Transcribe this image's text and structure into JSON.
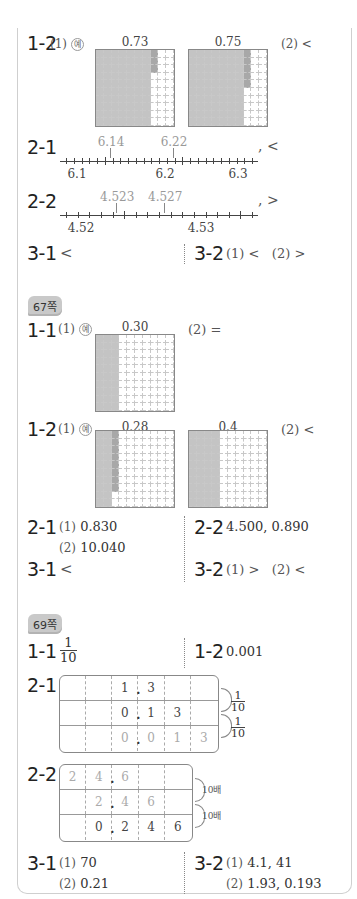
{
  "section_top": {
    "q1_2": {
      "label": "1-2",
      "part1": "(1)",
      "ex": "예",
      "grid_a_label": "0.73",
      "grid_b_label": "0.75",
      "part2": "(2) <"
    },
    "q2_1": {
      "label": "2-1",
      "marks": [
        "6.14",
        "6.22"
      ],
      "ticks": [
        "6.1",
        "6.2",
        "6.3"
      ],
      "answer": ", <"
    },
    "q2_2": {
      "label": "2-2",
      "marks": [
        "4.523",
        "4.527"
      ],
      "ticks": [
        "4.52",
        "4.53"
      ],
      "answer": ", >"
    },
    "q3_1": {
      "label": "3-1",
      "answer": "<"
    },
    "q3_2": {
      "label": "3-2",
      "p1": "(1) <",
      "p2": "(2) >"
    }
  },
  "page67": {
    "badge": "67쪽",
    "q1_1": {
      "label": "1-1",
      "part1": "(1)",
      "ex": "예",
      "grid_label": "0.30",
      "part2": "(2) ="
    },
    "q1_2": {
      "label": "1-2",
      "part1": "(1)",
      "ex": "예",
      "grid_a_label": "0.28",
      "grid_b_label": "0.4",
      "part2": "(2) <"
    },
    "q2_1": {
      "label": "2-1",
      "p1_num": "(1)",
      "p1": "0.830",
      "p2_num": "(2)",
      "p2": "10.040"
    },
    "q2_2": {
      "label": "2-2",
      "answer": "4.500, 0.890"
    },
    "q3_1": {
      "label": "3-1",
      "answer": "<"
    },
    "q3_2": {
      "label": "3-2",
      "p1": "(1) >",
      "p2": "(2) <"
    }
  },
  "page69": {
    "badge": "69쪽",
    "q1_1": {
      "label": "1-1",
      "num": "1",
      "den": "10"
    },
    "q1_2": {
      "label": "1-2",
      "answer": "0.001"
    },
    "q2_1": {
      "label": "2-1",
      "rows": [
        [
          "",
          "",
          "1",
          "3",
          "",
          ""
        ],
        [
          "",
          "",
          "0",
          "1",
          "3",
          ""
        ],
        [
          "",
          "",
          "0",
          "0",
          "1",
          "3"
        ]
      ],
      "arrow_num": "1",
      "arrow_den": "10"
    },
    "q2_2": {
      "label": "2-2",
      "rows": [
        [
          "2",
          "4",
          "6",
          "",
          ""
        ],
        [
          "",
          "2",
          "4",
          "6",
          ""
        ],
        [
          "",
          "0",
          "2",
          "4",
          "6"
        ]
      ],
      "arrow_label": "10배"
    },
    "q3_1": {
      "label": "3-1",
      "p1_num": "(1)",
      "p1": "70",
      "p2_num": "(2)",
      "p2": "0.21"
    },
    "q3_2": {
      "label": "3-2",
      "p1_num": "(1)",
      "p1": "4.1, 41",
      "p2_num": "(2)",
      "p2": "1.93, 0.193"
    }
  }
}
